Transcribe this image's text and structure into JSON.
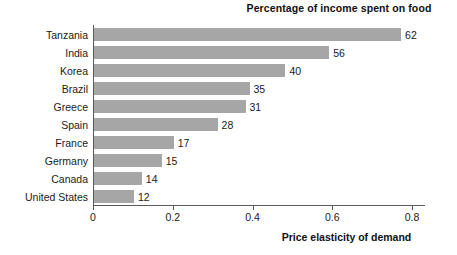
{
  "chart_data": {
    "type": "bar",
    "orientation": "horizontal",
    "title": "Percentage of income spent on food",
    "xlabel": "Price elasticity of demand",
    "ylabel": "",
    "xlim": [
      0,
      0.82
    ],
    "xticks": [
      "0",
      "0.2",
      "0.4",
      "0.6",
      "0.8"
    ],
    "xtick_values": [
      0,
      0.2,
      0.4,
      0.6,
      0.8
    ],
    "grid": false,
    "legend": false,
    "bar_color": "#a6a6a6",
    "categories": [
      "Tanzania",
      "India",
      "Korea",
      "Brazil",
      "Greece",
      "Spain",
      "France",
      "Germany",
      "Canada",
      "United States"
    ],
    "values": [
      0.77,
      0.59,
      0.48,
      0.39,
      0.38,
      0.31,
      0.2,
      0.17,
      0.12,
      0.1
    ],
    "data_labels": [
      "62",
      "56",
      "40",
      "35",
      "31",
      "28",
      "17",
      "15",
      "14",
      "12"
    ],
    "series": [
      {
        "name": "Price elasticity of demand",
        "values": [
          0.77,
          0.59,
          0.48,
          0.39,
          0.38,
          0.31,
          0.2,
          0.17,
          0.12,
          0.1
        ]
      },
      {
        "name": "Percentage of income spent on food",
        "values": [
          62,
          56,
          40,
          35,
          31,
          28,
          17,
          15,
          14,
          12
        ]
      }
    ],
    "rows": [
      {
        "category": "Tanzania",
        "elasticity": 0.77,
        "percent": "62"
      },
      {
        "category": "India",
        "elasticity": 0.59,
        "percent": "56"
      },
      {
        "category": "Korea",
        "elasticity": 0.48,
        "percent": "40"
      },
      {
        "category": "Brazil",
        "elasticity": 0.39,
        "percent": "35"
      },
      {
        "category": "Greece",
        "elasticity": 0.38,
        "percent": "31"
      },
      {
        "category": "Spain",
        "elasticity": 0.31,
        "percent": "28"
      },
      {
        "category": "France",
        "elasticity": 0.2,
        "percent": "17"
      },
      {
        "category": "Germany",
        "elasticity": 0.17,
        "percent": "15"
      },
      {
        "category": "Canada",
        "elasticity": 0.12,
        "percent": "14"
      },
      {
        "category": "United States",
        "elasticity": 0.1,
        "percent": "12"
      }
    ]
  }
}
